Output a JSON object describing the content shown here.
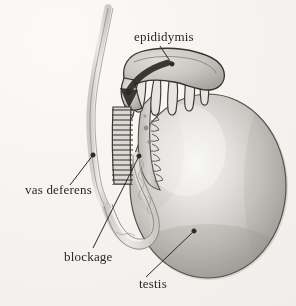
{
  "figure": {
    "medium": "pencil and wash medical illustration",
    "background_color": "#f6f5f3",
    "ink_color": "#2b2723"
  },
  "labels": {
    "epididymis": "epididymis",
    "vas_deferens": "vas deferens",
    "blockage": "blockage",
    "testis": "testis"
  },
  "structures": {
    "testis": {
      "name": "testis",
      "shape": "large oval",
      "fill_light": "#f2f1ee",
      "fill_mid": "#c8c6c2",
      "fill_dark": "#a09d98",
      "outline": "#5c5854"
    },
    "epididymis": {
      "name": "epididymis",
      "shape": "curved cap with finger-like tubules",
      "fill": "#cfcdc8",
      "outline": "#3a3632",
      "tubule_count": 6
    },
    "vas_deferens": {
      "name": "vas deferens",
      "shape": "long wavy double-walled duct",
      "fill": "#dedcd8",
      "outline": "#8d8984"
    },
    "blockage": {
      "name": "blockage",
      "shape": "hatched occluded duct segment",
      "hatch_color": "#3a3632",
      "hatch_lines": 17
    },
    "flow_arrow": {
      "name": "sperm flow arrow",
      "direction": "downward toward blockage",
      "color": "#2e2a26"
    }
  },
  "leaders": [
    {
      "label": "epididymis",
      "endpoint": "epididymis head"
    },
    {
      "label": "vas deferens",
      "endpoint": "vas deferens duct"
    },
    {
      "label": "blockage",
      "endpoint": "hatched duct segment"
    },
    {
      "label": "testis",
      "endpoint": "testis body"
    }
  ]
}
